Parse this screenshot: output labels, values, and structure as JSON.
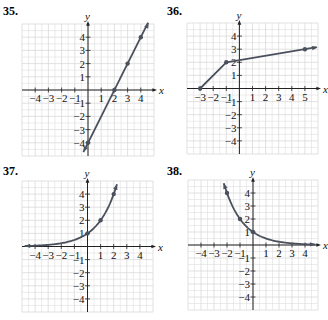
{
  "style": {
    "grid_color": "#d9d9d9",
    "axis_color": "#222222",
    "curve_color": "#4a505c",
    "point_color": "#4a505c",
    "label_color": "#111111"
  },
  "chart_data": [
    {
      "id": "35",
      "number_label": "35.",
      "type": "line",
      "title": "35.",
      "xlabel": "x",
      "ylabel": "y",
      "xlim": [
        -5,
        5
      ],
      "ylim": [
        -5,
        5
      ],
      "grid": true,
      "x_tick_labels": [
        "-4",
        "-3",
        "-2",
        "-1",
        "1",
        "2",
        "3",
        "4"
      ],
      "y_tick_labels": [
        "-4",
        "-3",
        "-2",
        "-1",
        "1",
        "2",
        "3",
        "4"
      ],
      "series": [
        {
          "name": "y = 2x - 4",
          "kind": "line",
          "x": [
            -0.35,
            4.55
          ],
          "y": [
            -4.7,
            5.1
          ],
          "arrows": "both",
          "points": [
            [
              0,
              -4
            ],
            [
              2,
              0
            ],
            [
              3,
              2
            ],
            [
              4,
              4
            ]
          ]
        }
      ]
    },
    {
      "id": "36",
      "number_label": "36.",
      "type": "line",
      "title": "36.",
      "xlabel": "x",
      "ylabel": "y",
      "xlim": [
        -4,
        6
      ],
      "ylim": [
        -5,
        5
      ],
      "grid": true,
      "x_tick_labels": [
        "-3",
        "-2",
        "-1",
        "1",
        "2",
        "3",
        "4",
        "5"
      ],
      "y_tick_labels": [
        "-4",
        "-3",
        "-2",
        "-1",
        "1",
        "2",
        "3",
        "4"
      ],
      "series": [
        {
          "name": "piecewise linear",
          "kind": "polyline",
          "x": [
            -3,
            -1,
            5.9
          ],
          "y": [
            0,
            2,
            3.15
          ],
          "arrows": "end",
          "points": [
            [
              -3,
              0
            ],
            [
              -1,
              2
            ],
            [
              5,
              3
            ]
          ]
        }
      ]
    },
    {
      "id": "37",
      "number_label": "37.",
      "type": "line",
      "title": "37.",
      "xlabel": "x",
      "ylabel": "y",
      "xlim": [
        -5,
        5
      ],
      "ylim": [
        -5,
        5
      ],
      "grid": true,
      "x_tick_labels": [
        "-4",
        "-3",
        "-2",
        "-1",
        "1",
        "2",
        "3",
        "4"
      ],
      "y_tick_labels": [
        "-4",
        "-3",
        "-2",
        "-1",
        "1",
        "2",
        "3",
        "4"
      ],
      "series": [
        {
          "name": "y = 2^x",
          "kind": "function",
          "base": 2,
          "domain": [
            -4.8,
            2.25
          ],
          "arrows": "both",
          "points": [
            [
              0,
              1
            ],
            [
              1,
              2
            ],
            [
              2,
              4
            ]
          ]
        }
      ]
    },
    {
      "id": "38",
      "number_label": "38.",
      "type": "line",
      "title": "38.",
      "xlabel": "x",
      "ylabel": "y",
      "xlim": [
        -5,
        5
      ],
      "ylim": [
        -5,
        5
      ],
      "grid": true,
      "x_tick_labels": [
        "-4",
        "-3",
        "-2",
        "-1",
        "1",
        "2",
        "3",
        "4"
      ],
      "y_tick_labels": [
        "-4",
        "-3",
        "-2",
        "-1",
        "1",
        "2",
        "3",
        "4"
      ],
      "series": [
        {
          "name": "y = (1/2)^x",
          "kind": "function",
          "base": 0.5,
          "domain": [
            -2.25,
            4.8
          ],
          "arrows": "both",
          "points": [
            [
              -2,
              4
            ],
            [
              -1,
              2
            ],
            [
              0,
              1
            ]
          ]
        }
      ]
    }
  ],
  "layout": [
    {
      "left": 0,
      "top": 0,
      "label_x": 3,
      "label_y": 4,
      "x0": 22,
      "y0": 24,
      "unit": 13.2
    },
    {
      "left": 164,
      "top": 0,
      "label_x": 3,
      "label_y": 4,
      "x0": 23,
      "y0": 23,
      "unit": 13.1
    },
    {
      "left": 0,
      "top": 160,
      "label_x": 3,
      "label_y": 4,
      "x0": 22,
      "y0": 21,
      "unit": 13.1
    },
    {
      "left": 164,
      "top": 160,
      "label_x": 3,
      "label_y": 4,
      "x0": 24,
      "y0": 20,
      "unit": 13.0
    }
  ]
}
